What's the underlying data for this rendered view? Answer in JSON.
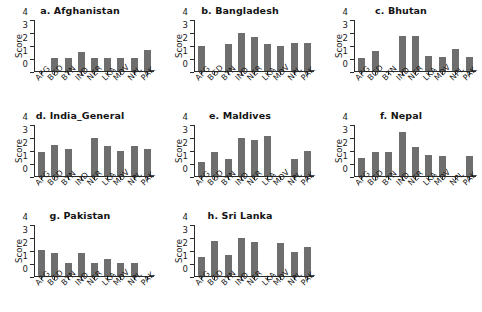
{
  "chart_data": {
    "type": "bar",
    "title": "",
    "xlabel": "",
    "ylabel": "Score",
    "ylim": [
      0,
      4
    ],
    "yticks": [
      "0",
      "1",
      "2",
      "3",
      "4"
    ],
    "grid": false,
    "legend": "none",
    "categories": [
      "AFG",
      "BGD",
      "BTN",
      "IND",
      "NER",
      "LKA",
      "MDV",
      "NPL",
      "PAK"
    ],
    "panels": [
      {
        "title": "a. Afghanistan",
        "values": [
          0,
          1.0,
          1.0,
          1.5,
          1.05,
          1.05,
          1.0,
          1.0,
          1.65
        ]
      },
      {
        "title": "b. Bangladesh",
        "values": [
          1.95,
          0,
          2.1,
          3.0,
          2.7,
          2.15,
          2.0,
          2.2,
          2.2
        ]
      },
      {
        "title": "c. Bhutan",
        "values": [
          1.0,
          1.6,
          0,
          2.75,
          2.75,
          1.15,
          1.1,
          1.75,
          1.1
        ]
      },
      {
        "title": "d. India_General",
        "values": [
          1.9,
          2.45,
          2.15,
          0,
          2.95,
          2.35,
          1.95,
          2.35,
          2.1
        ]
      },
      {
        "title": "e. Maldives",
        "values": [
          1.1,
          1.85,
          1.35,
          2.95,
          2.85,
          3.1,
          0,
          1.3,
          2.0
        ]
      },
      {
        "title": "f. Nepal",
        "values": [
          1.4,
          1.9,
          1.85,
          3.45,
          2.3,
          1.65,
          1.55,
          0,
          1.55
        ]
      },
      {
        "title": "g. Pakistan",
        "values": [
          2.05,
          1.8,
          1.05,
          1.8,
          1.05,
          1.35,
          1.05,
          1.05,
          0
        ]
      },
      {
        "title": "h. Sri Lanka",
        "values": [
          1.5,
          2.75,
          1.65,
          2.95,
          2.7,
          0,
          2.6,
          1.9,
          2.25
        ]
      }
    ],
    "colors": {
      "bar": "#6e6e6e",
      "axis": "#2b2b2b",
      "text": "#1a1a1a",
      "background": "#ffffff"
    }
  }
}
